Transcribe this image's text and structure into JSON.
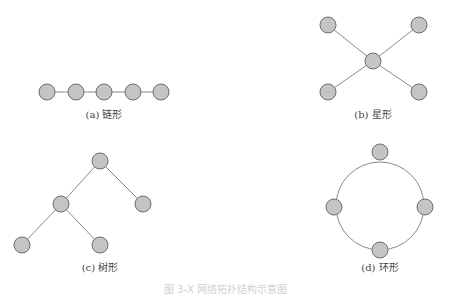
{
  "panels": [
    {
      "id": "a",
      "caption": "(a) 链形",
      "type": "chain",
      "nodes": [
        [
          47,
          92
        ],
        [
          76,
          92
        ],
        [
          104,
          92
        ],
        [
          133,
          92
        ],
        [
          161,
          92
        ]
      ],
      "edges": [
        [
          0,
          1
        ],
        [
          1,
          2
        ],
        [
          2,
          3
        ],
        [
          3,
          4
        ]
      ],
      "caption_pos": [
        104,
        110
      ]
    },
    {
      "id": "b",
      "caption": "(b) 星形",
      "type": "star",
      "nodes": [
        [
          373,
          61
        ],
        [
          328,
          25
        ],
        [
          419,
          25
        ],
        [
          328,
          92
        ],
        [
          419,
          92
        ]
      ],
      "edges": [
        [
          0,
          1
        ],
        [
          0,
          2
        ],
        [
          0,
          3
        ],
        [
          0,
          4
        ]
      ],
      "caption_pos": [
        373,
        110
      ]
    },
    {
      "id": "c",
      "caption": "(c) 树形",
      "type": "tree",
      "nodes": [
        [
          100,
          161
        ],
        [
          61,
          204
        ],
        [
          143,
          204
        ],
        [
          22,
          245
        ],
        [
          100,
          245
        ]
      ],
      "edges": [
        [
          0,
          1
        ],
        [
          0,
          2
        ],
        [
          1,
          3
        ],
        [
          1,
          4
        ]
      ],
      "caption_pos": [
        100,
        263
      ]
    },
    {
      "id": "d",
      "caption": "(d) 环形",
      "type": "ring",
      "ring": {
        "cx": 380,
        "cy": 206,
        "r": 44
      },
      "nodes": [
        [
          380,
          152
        ],
        [
          334,
          207
        ],
        [
          425,
          207
        ],
        [
          380,
          250
        ]
      ],
      "edges": [],
      "caption_pos": [
        380,
        263
      ]
    }
  ],
  "figure_caption": "图 3-X  网络拓扑结构示意图",
  "style": {
    "node_fill": "#c4c4c4",
    "node_stroke": "#6e6e6e",
    "edge_color": "#8a8a8a",
    "node_radius": 8
  }
}
